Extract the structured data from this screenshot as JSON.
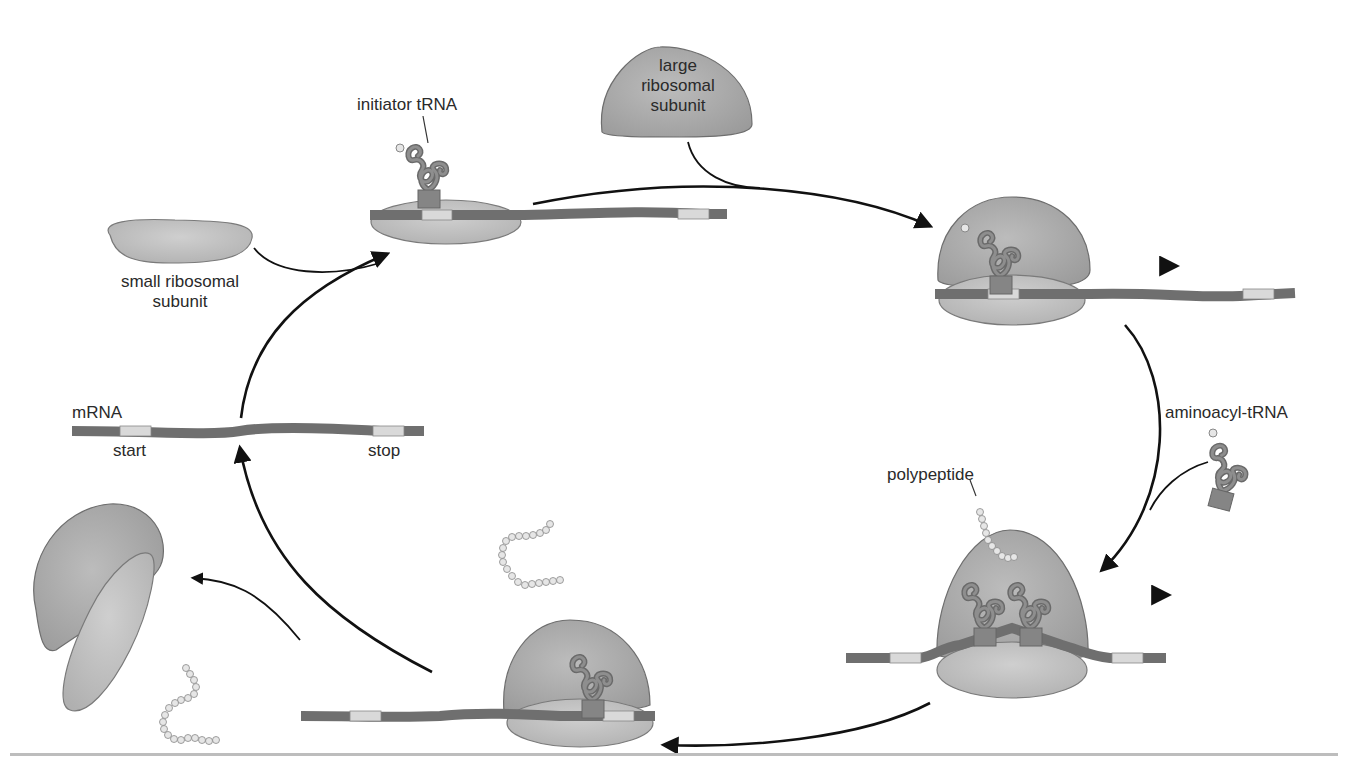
{
  "diagram": {
    "colors": {
      "ribosome_fill": "#a9a9a9",
      "ribosome_stroke": "#6e6e6e",
      "small_subunit_fill": "#bdbdbd",
      "mrna": "#6f6f6f",
      "codon_box": "#d9d9d9",
      "trna": "#767676",
      "bead": "#e6e6e6",
      "arrow": "#111111",
      "rule": "#bdbdbd"
    },
    "labels": {
      "initiator_trna": "initiator tRNA",
      "large_subunit_line1": "large",
      "large_subunit_line2": "ribosomal",
      "large_subunit_line3": "subunit",
      "small_subunit_line1": "small ribosomal",
      "small_subunit_line2": "subunit",
      "mrna": "mRNA",
      "start": "start",
      "stop": "stop",
      "aminoacyl_trna": "aminoacyl-tRNA",
      "polypeptide": "polypeptide"
    },
    "steps": [
      {
        "id": "free-mrna",
        "description": "mRNA with start and stop codons"
      },
      {
        "id": "initiation-complex",
        "description": "small subunit + initiator tRNA bound at start codon"
      },
      {
        "id": "large-subunit-joins",
        "description": "complete ribosome assembled, moving along mRNA"
      },
      {
        "id": "elongation",
        "description": "aminoacyl-tRNA enters, polypeptide grows"
      },
      {
        "id": "termination",
        "description": "ribosome reaches stop codon"
      },
      {
        "id": "dissociation",
        "description": "subunits and polypeptide released"
      }
    ]
  }
}
